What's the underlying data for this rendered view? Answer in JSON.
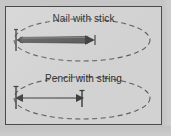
{
  "figure": {
    "frame_border_color": "#4a4a4a",
    "background_color": "#d2d2d2",
    "panels": [
      {
        "id": "nail-with-stick",
        "caption": "Nail with stick",
        "ellipse": {
          "center_x": 76,
          "center_y": 33,
          "radius_x": 68,
          "radius_y": 21,
          "style": "dashed",
          "stroke_color": "#5e5e5e"
        },
        "tool": {
          "type": "nail-and-stick",
          "pivot_x": 10,
          "tip_x": 86,
          "axis_y": 33,
          "arrow_direction": "right",
          "bar_color": "#5a5a5a"
        }
      },
      {
        "id": "pencil-with-string",
        "caption": "Pencil with string",
        "ellipse": {
          "center_x": 76,
          "center_y": 31,
          "radius_x": 68,
          "radius_y": 21,
          "style": "dashed",
          "stroke_color": "#5e5e5e"
        },
        "tool": {
          "type": "pencil-and-string",
          "pivot_x": 10,
          "tip_x": 76,
          "axis_y": 31,
          "arrow_direction": "both",
          "line_color": "#3a3a3a"
        }
      }
    ]
  }
}
